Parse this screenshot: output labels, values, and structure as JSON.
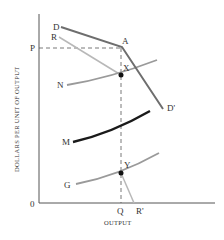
{
  "diagram": {
    "ylabel": "DOLLARS PER UNIT OF OUTPUT",
    "xlabel": "OUTPUT",
    "origin_label": "0",
    "price_label": "P",
    "quantity_label": "Q",
    "points": {
      "A": "A",
      "X": "X",
      "Y": "Y"
    },
    "curves": {
      "demand_start": "D",
      "demand_end": "D'",
      "mr_start": "R",
      "mr_end": "R'",
      "N": "N",
      "M": "M",
      "G": "G"
    },
    "colors": {
      "demand": "#6e6e6e",
      "mr": "#b8b8b8",
      "n_curve": "#9a9a9a",
      "m_curve": "#1a1a1a",
      "g_curve": "#9a9a9a",
      "axes": "#555555"
    }
  }
}
